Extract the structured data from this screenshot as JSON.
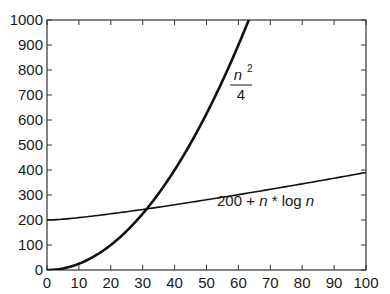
{
  "chart_data": {
    "type": "line",
    "title": "",
    "xlabel": "",
    "ylabel": "",
    "xlim": [
      0,
      100
    ],
    "ylim": [
      0,
      1000
    ],
    "x_ticks": [
      0,
      10,
      20,
      30,
      40,
      50,
      60,
      70,
      80,
      90,
      100
    ],
    "y_ticks": [
      0,
      100,
      200,
      300,
      400,
      500,
      600,
      700,
      800,
      900,
      1000
    ],
    "grid": false,
    "legend": "none (inline curve labels)",
    "series": [
      {
        "name": "n^2/4",
        "label_numerator": "n",
        "label_exponent": "2",
        "label_denominator": "4",
        "formula": "n*n/4",
        "x": [
          0,
          10,
          20,
          30,
          40,
          50,
          60,
          63.2
        ],
        "values": [
          0,
          25,
          100,
          225,
          400,
          625,
          900,
          1000
        ]
      },
      {
        "name": "200 + n * log n",
        "label_parts": [
          "200 + ",
          "n",
          " * log ",
          "n"
        ],
        "formula": "200 + n*log2(n)",
        "x": [
          0,
          10,
          20,
          30,
          40,
          50,
          60,
          70,
          80,
          90,
          100
        ],
        "values": [
          200,
          233,
          286,
          347,
          413,
          482,
          554,
          629,
          706,
          784,
          864
        ]
      }
    ],
    "annotations": [
      {
        "text": "n²/4",
        "near_x": 58,
        "near_y": 730
      },
      {
        "text": "200 + n * log n",
        "near_x": 62,
        "near_y": 265
      }
    ]
  }
}
